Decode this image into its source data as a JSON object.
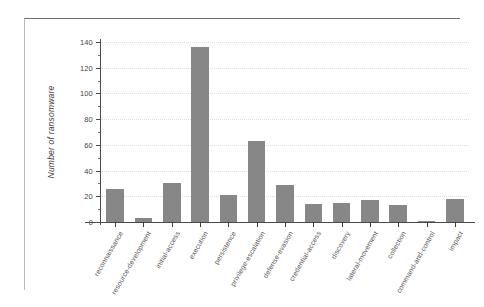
{
  "chart_data": {
    "type": "bar",
    "title": "",
    "subtitle": "",
    "xlabel": "",
    "ylabel": "Number of ransomware",
    "categories": [
      "reconnaissance",
      "resource-development",
      "initial-access",
      "execution",
      "persistence",
      "privilege-escalation",
      "defense-evasion",
      "credential-access",
      "discovery",
      "lateral-movement",
      "collection",
      "command-and-control",
      "impact"
    ],
    "values": [
      26,
      3,
      30,
      136,
      21,
      63,
      29,
      14,
      15,
      17,
      13,
      1,
      18
    ],
    "ylim": [
      0,
      140
    ],
    "ytick_labels": [
      "0",
      "20",
      "40",
      "60",
      "80",
      "100",
      "120",
      "140"
    ],
    "ytick_values": [
      0,
      20,
      40,
      60,
      80,
      100,
      120,
      140
    ],
    "yminor_interval": 10,
    "grid": true,
    "legend": false,
    "legend_position": "none",
    "bar_color": "#878787",
    "axis_color": "#4a4a4a",
    "grid_color": "#dddddd",
    "label_rotation": -60
  }
}
